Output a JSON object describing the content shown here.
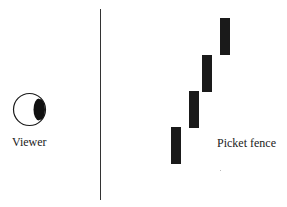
{
  "diagram": {
    "viewer_label": "Viewer",
    "fence_label": "Picket fence",
    "colors": {
      "ink": "#1a1a1a",
      "line": "#333333",
      "background": "#ffffff"
    },
    "pickets": [
      {
        "x": 171,
        "y": 127
      },
      {
        "x": 189,
        "y": 91
      },
      {
        "x": 202,
        "y": 55
      },
      {
        "x": 220,
        "y": 18
      }
    ]
  }
}
